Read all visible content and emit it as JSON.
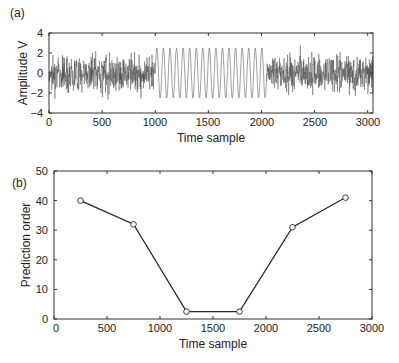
{
  "chart_data": [
    {
      "panel": "(a)",
      "type": "line",
      "title": "",
      "xlabel": "Time sample",
      "ylabel": "Amplitude V",
      "xlim": [
        0,
        3050
      ],
      "ylim": [
        -4,
        4
      ],
      "x_ticks": [
        0,
        500,
        1000,
        1500,
        2000,
        2500,
        3000
      ],
      "y_ticks": [
        -4,
        -2,
        0,
        2,
        4
      ],
      "grid": false,
      "segments": [
        {
          "name": "noise",
          "x_range": [
            0,
            1000
          ],
          "description": "random noise, amplitude roughly ±2.5"
        },
        {
          "name": "sinusoid",
          "x_range": [
            1000,
            2050
          ],
          "amplitude": 2.5,
          "cycles": 17,
          "description": "pure sine wave"
        },
        {
          "name": "noise",
          "x_range": [
            2050,
            3050
          ],
          "description": "random noise, amplitude roughly ±2.5"
        }
      ]
    },
    {
      "panel": "(b)",
      "type": "line",
      "title": "",
      "xlabel": "Time sample",
      "ylabel": "Prediction order",
      "xlim": [
        0,
        3000
      ],
      "ylim": [
        0,
        50
      ],
      "x_ticks": [
        0,
        500,
        1000,
        1500,
        2000,
        2500,
        3000
      ],
      "y_ticks": [
        0,
        10,
        20,
        30,
        40,
        50
      ],
      "grid": false,
      "marker": "circle",
      "x": [
        250,
        750,
        1250,
        1750,
        2250,
        2750
      ],
      "series": [
        {
          "name": "Prediction order",
          "values": [
            40,
            32,
            2.5,
            2.5,
            31,
            41
          ]
        }
      ]
    }
  ],
  "labels": {
    "panel_a": "(a)",
    "panel_b": "(b)",
    "a_xlabel": "Time sample",
    "a_ylabel": "Amplitude V",
    "b_xlabel": "Time sample",
    "b_ylabel": "Prediction order",
    "a_xticks": [
      "0",
      "500",
      "1000",
      "1500",
      "2000",
      "2500",
      "3000"
    ],
    "a_yticks": [
      "4",
      "2",
      "0",
      "−2",
      "−4"
    ],
    "b_xticks": [
      "0",
      "500",
      "1000",
      "1500",
      "2000",
      "2500",
      "3000"
    ],
    "b_yticks": [
      "50",
      "40",
      "30",
      "20",
      "10",
      "0"
    ]
  },
  "colors": {
    "axis": "#333333",
    "noise": "#444444",
    "sine": "#777777",
    "line_b": "#222222"
  }
}
